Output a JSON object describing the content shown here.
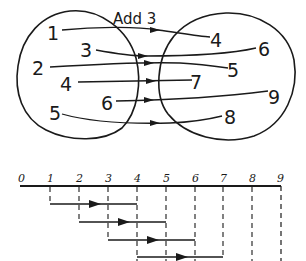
{
  "mapping_diagram": {
    "title": "Add 3",
    "domain_values": [
      "1",
      "2",
      "3",
      "4",
      "5",
      "6"
    ],
    "range_values": [
      "4",
      "5",
      "6",
      "7",
      "8",
      "9"
    ],
    "domain_labels": {
      "d1": "1",
      "d2": "2",
      "d3": "3",
      "d4": "4",
      "d5": "5",
      "d6": "6"
    },
    "range_labels": {
      "r4": "4",
      "r5": "5",
      "r6": "6",
      "r7": "7",
      "r8": "8",
      "r9": "9"
    },
    "mappings": [
      {
        "from": "1",
        "to": "4"
      },
      {
        "from": "2",
        "to": "5"
      },
      {
        "from": "3",
        "to": "6"
      },
      {
        "from": "4",
        "to": "7"
      },
      {
        "from": "5",
        "to": "8"
      },
      {
        "from": "6",
        "to": "9"
      }
    ]
  },
  "number_line": {
    "ticks": [
      "0",
      "1",
      "2",
      "3",
      "4",
      "5",
      "6",
      "7",
      "8",
      "9"
    ],
    "arrows": [
      {
        "from": "1",
        "to": "4"
      },
      {
        "from": "2",
        "to": "5"
      },
      {
        "from": "3",
        "to": "6"
      },
      {
        "from": "4",
        "to": "7"
      }
    ]
  },
  "colors": {
    "ink": "#1a1a1a",
    "background": "#ffffff"
  }
}
